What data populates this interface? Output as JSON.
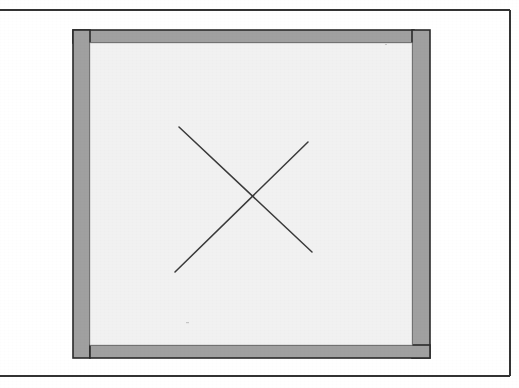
{
  "figure": {
    "kind": "technical-line-drawing",
    "background_color": "#ffffff",
    "ink_color": "#2b2b2b",
    "plate_border": {
      "name": "plate-border",
      "stroke_color": "#333333",
      "stroke_width": 2,
      "top_y": 10,
      "right_x": 510,
      "bottom_y": 376,
      "left_open": true
    },
    "frame": {
      "name": "panel-frame",
      "outer_left": 73,
      "outer_top": 30,
      "outer_right": 430,
      "outer_bottom": 358,
      "band_fill": "#a0a0a0",
      "band_outline_color": "#2b2b2b",
      "band_outline_width": 1.6,
      "members": [
        {
          "label": "top-rail",
          "x": 73,
          "y": 30,
          "width": 341,
          "height": 13
        },
        {
          "label": "bottom-rail",
          "x": 90,
          "y": 345,
          "width": 340,
          "height": 13
        },
        {
          "label": "left-stile",
          "x": 73,
          "y": 30,
          "width": 17,
          "height": 328
        },
        {
          "label": "right-stile",
          "x": 412,
          "y": 30,
          "width": 18,
          "height": 328
        }
      ]
    },
    "panel": {
      "name": "inner-panel",
      "x": 90,
      "y": 43,
      "width": 322,
      "height": 302,
      "fill": "#f1f1f1",
      "outline_color": "#bfbfbf",
      "outline_width": 0.8
    },
    "cross": {
      "name": "x-mark",
      "stroke_color": "#3a3a3a",
      "stroke_width": 1.5,
      "intersection": {
        "x": 246,
        "y": 198
      },
      "strokes": [
        {
          "label": "stroke-nw-se",
          "x1": 179,
          "y1": 127,
          "x2": 312,
          "y2": 252
        },
        {
          "label": "stroke-sw-ne",
          "x1": 175,
          "y1": 272,
          "x2": 308,
          "y2": 142
        }
      ]
    }
  }
}
